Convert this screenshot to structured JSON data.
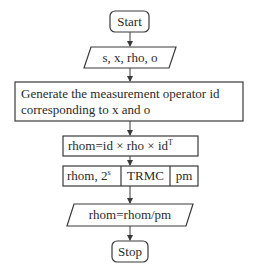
{
  "flowchart": {
    "start": {
      "label": "Start"
    },
    "input": {
      "label": "s, x, rho, o"
    },
    "generate": {
      "line1": "Generate the measurement operator id",
      "line2": "corresponding to x and o"
    },
    "compute": {
      "label": "rhom=id × rho × id",
      "superscript": "T"
    },
    "trmc": {
      "left_label": "rhom, 2",
      "left_superscript": "s",
      "middle_label": "TRMC",
      "right_label": "pm"
    },
    "output": {
      "label": "rhom=rhom/pm"
    },
    "stop": {
      "label": "Stop"
    }
  },
  "colors": {
    "stroke": "#3a3a3a",
    "text": "#2a2a2a",
    "background": "#ffffff"
  }
}
